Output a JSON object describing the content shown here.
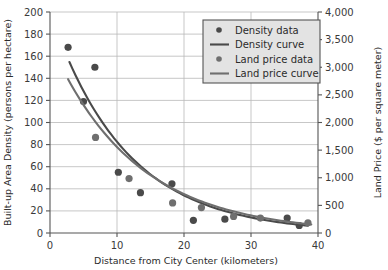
{
  "chart_data": {
    "type": "scatter",
    "title": "",
    "xlabel": "Distance from City Center (kilometers)",
    "ylabel": "Built-up Area Density (persons per hectare)",
    "y2label": "Land Price ($ per square meter)",
    "xlim": [
      0,
      40
    ],
    "xticks": [
      0,
      10,
      20,
      30,
      40
    ],
    "xticklabels": [
      "0",
      "10",
      "20",
      "30",
      "40"
    ],
    "ylim": [
      0,
      200
    ],
    "yticks": [
      0,
      20,
      40,
      60,
      80,
      100,
      120,
      140,
      160,
      180,
      200
    ],
    "yticklabels": [
      "0",
      "20",
      "40",
      "60",
      "80",
      "100",
      "120",
      "140",
      "160",
      "180",
      "200"
    ],
    "y2lim": [
      0,
      4000
    ],
    "y2ticks": [
      0,
      500,
      1000,
      1500,
      2000,
      2500,
      3000,
      3500,
      4000
    ],
    "y2ticklabels": [
      "0",
      "500",
      "1,000",
      "1,500",
      "2,000",
      "2,500",
      "3,000",
      "3,500",
      "4,000"
    ],
    "grid": "horizontal-and-major-vertical",
    "legend_position": "top-right",
    "series": [
      {
        "name": "Density data",
        "kind": "scatter",
        "axis": "left",
        "color": "#4a4a4a",
        "points": [
          {
            "x": 2.7,
            "y": 168
          },
          {
            "x": 6.7,
            "y": 150
          },
          {
            "x": 5.0,
            "y": 119
          },
          {
            "x": 10.2,
            "y": 55
          },
          {
            "x": 13.5,
            "y": 36.5
          },
          {
            "x": 18.2,
            "y": 44.5
          },
          {
            "x": 21.4,
            "y": 11.5
          },
          {
            "x": 26.1,
            "y": 12.5
          },
          {
            "x": 35.4,
            "y": 13.5
          },
          {
            "x": 37.2,
            "y": 6.8
          }
        ]
      },
      {
        "name": "Density curve",
        "kind": "line",
        "axis": "left",
        "color": "#4a4a4a",
        "model": "exponential",
        "a": 200,
        "b": 0.0885,
        "xrange": [
          2.9,
          38.5
        ]
      },
      {
        "name": "Land price data",
        "kind": "scatter",
        "axis": "right",
        "color": "#6f6f6f",
        "points": [
          {
            "x": 6.8,
            "y": 1730
          },
          {
            "x": 11.8,
            "y": 985
          },
          {
            "x": 18.3,
            "y": 545
          },
          {
            "x": 22.6,
            "y": 460
          },
          {
            "x": 27.4,
            "y": 300
          },
          {
            "x": 31.4,
            "y": 270
          },
          {
            "x": 38.5,
            "y": 185
          }
        ]
      },
      {
        "name": "Land price curve",
        "kind": "line",
        "axis": "right",
        "color": "#6f6f6f",
        "model": "exponential",
        "a": 3450,
        "b": 0.0795,
        "xrange": [
          2.7,
          39.0
        ]
      }
    ]
  },
  "legend": {
    "items": [
      {
        "label": "Density data",
        "marker": "dot",
        "color": "#4a4a4a"
      },
      {
        "label": "Density curve",
        "marker": "line",
        "color": "#4a4a4a"
      },
      {
        "label": "Land price data",
        "marker": "dot",
        "color": "#6f6f6f"
      },
      {
        "label": "Land price curve",
        "marker": "line",
        "color": "#6f6f6f"
      }
    ],
    "background": "#e3e3e3",
    "border": "#555555"
  },
  "style": {
    "axis_color": "#555555",
    "grid_color": "#b9b9b9",
    "text_color": "#2b2b2b",
    "background": "#ffffff"
  }
}
